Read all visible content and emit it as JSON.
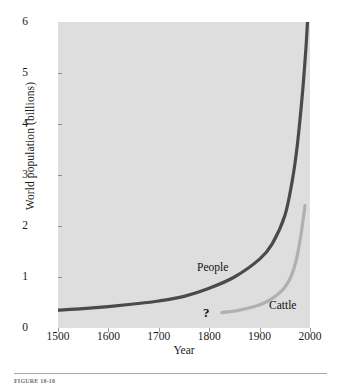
{
  "figure": {
    "caption": "FIGURE 18-18"
  },
  "chart_data": {
    "type": "line",
    "title": "",
    "xlabel": "Year",
    "ylabel": "World population (billions)",
    "xlim": [
      1500,
      2000
    ],
    "ylim": [
      0,
      6
    ],
    "xticks": [
      1500,
      1600,
      1700,
      1800,
      1900,
      2000
    ],
    "yticks": [
      0,
      1,
      2,
      3,
      4,
      5,
      6
    ],
    "grid": false,
    "legend_position": "inline-labels",
    "background_color": "#dedede",
    "annotations": [
      {
        "text": "?",
        "x": 1795,
        "y": 0.28,
        "name": "unknown-data-marker"
      }
    ],
    "series": [
      {
        "name": "People",
        "color": "#4a4a4a",
        "label_x": 1775,
        "label_y": 1.25,
        "points": [
          {
            "x": 1500,
            "y": 0.35
          },
          {
            "x": 1550,
            "y": 0.38
          },
          {
            "x": 1600,
            "y": 0.42
          },
          {
            "x": 1650,
            "y": 0.47
          },
          {
            "x": 1700,
            "y": 0.53
          },
          {
            "x": 1750,
            "y": 0.62
          },
          {
            "x": 1800,
            "y": 0.78
          },
          {
            "x": 1850,
            "y": 1.0
          },
          {
            "x": 1900,
            "y": 1.35
          },
          {
            "x": 1925,
            "y": 1.65
          },
          {
            "x": 1950,
            "y": 2.2
          },
          {
            "x": 1965,
            "y": 2.9
          },
          {
            "x": 1975,
            "y": 3.6
          },
          {
            "x": 1985,
            "y": 4.6
          },
          {
            "x": 1992,
            "y": 5.5
          },
          {
            "x": 1995,
            "y": 6.0
          }
        ]
      },
      {
        "name": "Cattle",
        "color": "#b0b0b0",
        "label_x": 1920,
        "label_y": 0.42,
        "points": [
          {
            "x": 1825,
            "y": 0.3
          },
          {
            "x": 1860,
            "y": 0.35
          },
          {
            "x": 1890,
            "y": 0.42
          },
          {
            "x": 1915,
            "y": 0.52
          },
          {
            "x": 1935,
            "y": 0.65
          },
          {
            "x": 1950,
            "y": 0.8
          },
          {
            "x": 1962,
            "y": 1.0
          },
          {
            "x": 1972,
            "y": 1.3
          },
          {
            "x": 1980,
            "y": 1.7
          },
          {
            "x": 1986,
            "y": 2.1
          },
          {
            "x": 1990,
            "y": 2.4
          }
        ]
      }
    ]
  }
}
